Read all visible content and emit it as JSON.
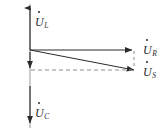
{
  "diagram": {
    "type": "phasor-diagram",
    "title": "",
    "stroke_color": "#2b2b2b",
    "background_color": "#ffffff",
    "labels": {
      "u_l": {
        "symbol": "U",
        "subscript": "L",
        "overdot": true
      },
      "u_c": {
        "symbol": "U",
        "subscript": "C",
        "overdot": true
      },
      "u_r": {
        "symbol": "U",
        "subscript": "R",
        "overdot": true
      },
      "u_s": {
        "symbol": "U",
        "subscript": "S",
        "overdot": true
      }
    },
    "geometry": {
      "origin": {
        "x": 30,
        "y": 50
      },
      "vertical_axis": {
        "top_y": 6,
        "bottom_y": 125
      },
      "u_l_tip": {
        "x": 30,
        "y": 6
      },
      "u_c_tip": {
        "x": 30,
        "y": 125
      },
      "u_l_minus_tip": {
        "x": 30,
        "y": 70
      },
      "u_r_tip": {
        "x": 134,
        "y": 50
      },
      "u_s_tip": {
        "x": 136,
        "y": 70
      },
      "dashed_horizontal": {
        "from_x": 30,
        "to_x": 134,
        "y": 70
      },
      "dashed_vertical": {
        "x": 134,
        "from_y": 50,
        "to_y": 70
      }
    }
  }
}
